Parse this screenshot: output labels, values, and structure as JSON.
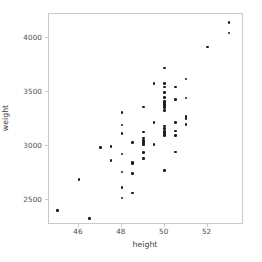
{
  "chart_data": {
    "type": "scatter",
    "title": "",
    "xlabel": "height",
    "ylabel": "weight",
    "xlim": [
      44.6,
      53.7
    ],
    "ylim": [
      2270,
      4220
    ],
    "grid": false,
    "legend": null,
    "xticks": [
      46,
      48,
      50,
      52
    ],
    "xtick_labels": [
      "46",
      "48",
      "50",
      "52"
    ],
    "yticks": [
      2500,
      3000,
      3500,
      4000
    ],
    "ytick_labels": [
      "2500",
      "3000",
      "3500",
      "4000"
    ],
    "marker": {
      "shape": "circle",
      "color": "#1a1a1a",
      "size_px": 2.6
    },
    "n_points": 96,
    "points": [
      {
        "x": 45.0,
        "y": 2405
      },
      {
        "x": 46.0,
        "y": 2690
      },
      {
        "x": 46.5,
        "y": 2330
      },
      {
        "x": 47.0,
        "y": 2985
      },
      {
        "x": 47.5,
        "y": 2995
      },
      {
        "x": 47.5,
        "y": 2865
      },
      {
        "x": 48.0,
        "y": 3310
      },
      {
        "x": 48.0,
        "y": 3195
      },
      {
        "x": 48.0,
        "y": 3115
      },
      {
        "x": 48.0,
        "y": 2925
      },
      {
        "x": 48.0,
        "y": 2760
      },
      {
        "x": 48.0,
        "y": 2615
      },
      {
        "x": 48.0,
        "y": 2520
      },
      {
        "x": 48.5,
        "y": 3030
      },
      {
        "x": 48.5,
        "y": 2850
      },
      {
        "x": 48.5,
        "y": 2840
      },
      {
        "x": 48.5,
        "y": 2745
      },
      {
        "x": 48.5,
        "y": 2565
      },
      {
        "x": 49.0,
        "y": 3360
      },
      {
        "x": 49.0,
        "y": 3130
      },
      {
        "x": 49.0,
        "y": 3075
      },
      {
        "x": 49.0,
        "y": 3050
      },
      {
        "x": 49.0,
        "y": 3035
      },
      {
        "x": 49.0,
        "y": 3020
      },
      {
        "x": 49.0,
        "y": 3010
      },
      {
        "x": 49.0,
        "y": 2940
      },
      {
        "x": 49.0,
        "y": 2885
      },
      {
        "x": 49.5,
        "y": 3580
      },
      {
        "x": 49.5,
        "y": 3220
      },
      {
        "x": 49.5,
        "y": 3015
      },
      {
        "x": 50.0,
        "y": 3720
      },
      {
        "x": 50.0,
        "y": 3580
      },
      {
        "x": 50.0,
        "y": 3545
      },
      {
        "x": 50.0,
        "y": 3495
      },
      {
        "x": 50.0,
        "y": 3450
      },
      {
        "x": 50.0,
        "y": 3415
      },
      {
        "x": 50.0,
        "y": 3400
      },
      {
        "x": 50.0,
        "y": 3385
      },
      {
        "x": 50.0,
        "y": 3370
      },
      {
        "x": 50.0,
        "y": 3355
      },
      {
        "x": 50.0,
        "y": 3330
      },
      {
        "x": 50.0,
        "y": 3185
      },
      {
        "x": 50.0,
        "y": 3160
      },
      {
        "x": 50.0,
        "y": 3140
      },
      {
        "x": 50.0,
        "y": 3125
      },
      {
        "x": 50.0,
        "y": 3110
      },
      {
        "x": 50.0,
        "y": 3095
      },
      {
        "x": 50.0,
        "y": 2775
      },
      {
        "x": 50.5,
        "y": 3545
      },
      {
        "x": 50.5,
        "y": 3430
      },
      {
        "x": 50.5,
        "y": 3215
      },
      {
        "x": 50.5,
        "y": 3140
      },
      {
        "x": 50.5,
        "y": 3095
      },
      {
        "x": 50.5,
        "y": 2945
      },
      {
        "x": 51.0,
        "y": 3620
      },
      {
        "x": 51.0,
        "y": 3445
      },
      {
        "x": 51.0,
        "y": 3275
      },
      {
        "x": 51.0,
        "y": 3255
      },
      {
        "x": 51.0,
        "y": 3200
      },
      {
        "x": 52.0,
        "y": 3915
      },
      {
        "x": 53.0,
        "y": 4140
      },
      {
        "x": 53.0,
        "y": 4045
      }
    ]
  }
}
